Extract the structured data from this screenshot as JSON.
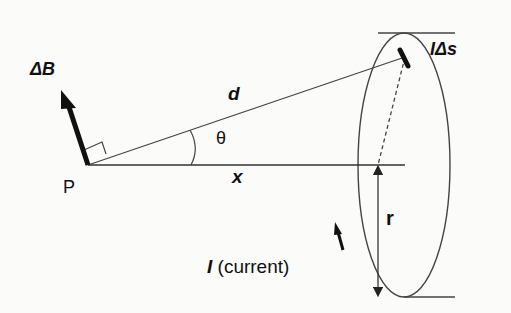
{
  "labels": {
    "delta_b": "ΔB",
    "point": "P",
    "d": "d",
    "theta": "θ",
    "x": "x",
    "ids": "IΔs",
    "r": "r",
    "current_symbol": "I",
    "current_text": "(current)"
  },
  "colors": {
    "line": "#333333",
    "arrow": "#111111",
    "background": "#fbfbfa"
  }
}
